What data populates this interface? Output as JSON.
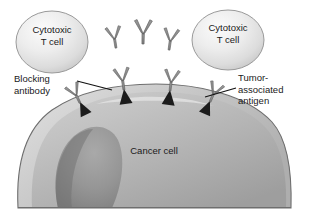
{
  "figure": {
    "background_color": "#ffffff"
  },
  "colors": {
    "background": "#ffffff",
    "text": "#1a1a1a",
    "tcell_fill_light": "#f2f2f2",
    "tcell_fill_mid": "#d9d9d9",
    "tcell_outline": "#8c8c8c",
    "cancer_cell_light": "#d6d6d6",
    "cancer_cell_mid": "#b5b5b5",
    "cancer_cell_dark": "#8f8f8f",
    "cancer_cell_outline": "#6e6e6e",
    "antibody_gray": "#8a8a8a",
    "antibody_outline": "#5f5f5f",
    "antigen_dark": "#1c1c1c",
    "leader_line": "#111111"
  },
  "labels": {
    "tcell_left": "Cytotoxic\nT cell",
    "tcell_right": "Cytotoxic\nT cell",
    "blocking_antibody": "Blocking\nantibody",
    "tumor_antigen": "Tumor-\nassociated\nantigen",
    "cancer_cell": "Cancer cell"
  },
  "elements": {
    "t_cells": [
      {
        "name": "cytotoxic-t-cell-left",
        "cx": 52,
        "cy": 42,
        "rx": 36,
        "ry": 31
      },
      {
        "name": "cytotoxic-t-cell-right",
        "cx": 228,
        "cy": 40,
        "rx": 36,
        "ry": 30
      }
    ],
    "free_antibodies": [
      {
        "name": "free-antibody-1",
        "x": 114,
        "y": 22,
        "rotate": -8,
        "scale": 1.0
      },
      {
        "name": "free-antibody-2",
        "x": 140,
        "y": 14,
        "rotate": 0,
        "scale": 1.1
      },
      {
        "name": "free-antibody-3",
        "x": 166,
        "y": 24,
        "rotate": 6,
        "scale": 1.0
      }
    ],
    "bound_antibodies": [
      {
        "name": "bound-antibody-1",
        "x": 82,
        "y": 68,
        "rotate": -22,
        "scale": 0.95
      },
      {
        "name": "bound-antibody-2",
        "x": 124,
        "y": 54,
        "rotate": -6,
        "scale": 1.05
      },
      {
        "name": "bound-antibody-3",
        "x": 162,
        "y": 58,
        "rotate": 6,
        "scale": 1.0
      },
      {
        "name": "bound-antibody-4",
        "x": 198,
        "y": 68,
        "rotate": 20,
        "scale": 0.95
      }
    ],
    "antigens": [
      {
        "name": "tumor-antigen-1",
        "x": 80,
        "y": 100,
        "rotate": -26
      },
      {
        "name": "tumor-antigen-2",
        "x": 122,
        "y": 88,
        "rotate": -8
      },
      {
        "name": "tumor-antigen-3",
        "x": 168,
        "y": 90,
        "rotate": 6
      },
      {
        "name": "tumor-antigen-4",
        "x": 208,
        "y": 100,
        "rotate": 22
      }
    ],
    "cancer_cell": {
      "name": "cancer-cell-body",
      "left": 18,
      "right": 292,
      "top": 92,
      "bottom": 208
    },
    "leader_lines": [
      {
        "name": "leader-line-blocking-antibody",
        "x1": 78,
        "y1": 82,
        "x2": 114,
        "y2": 90
      },
      {
        "name": "leader-line-tumor-antigen",
        "x1": 236,
        "y1": 88,
        "x2": 206,
        "y2": 96
      }
    ]
  }
}
